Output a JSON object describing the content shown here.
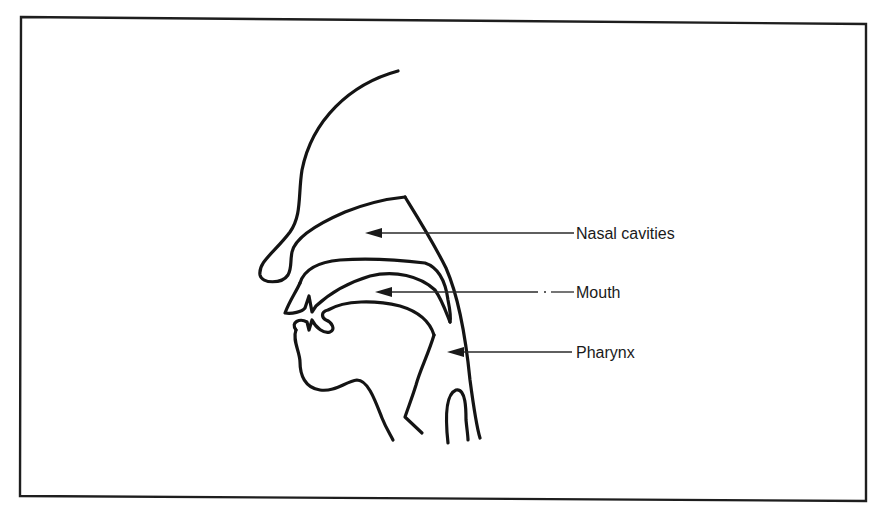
{
  "figure": {
    "type": "anatomical-diagram",
    "colors": {
      "line": "#141414",
      "background": "#ffffff"
    },
    "labels": [
      {
        "id": "nasal",
        "text": "Nasal cavities",
        "x": 576,
        "y": 226,
        "arrow_from_x": 574,
        "arrow_to_x": 365,
        "arrow_y": 233
      },
      {
        "id": "mouth",
        "text": "Mouth",
        "x": 576,
        "y": 285,
        "arrow_from_x": 574,
        "arrow_to_x": 375,
        "arrow_y": 292
      },
      {
        "id": "pharynx",
        "text": "Pharynx",
        "x": 576,
        "y": 345,
        "arrow_from_x": 572,
        "arrow_to_x": 447,
        "arrow_y": 352
      }
    ]
  }
}
